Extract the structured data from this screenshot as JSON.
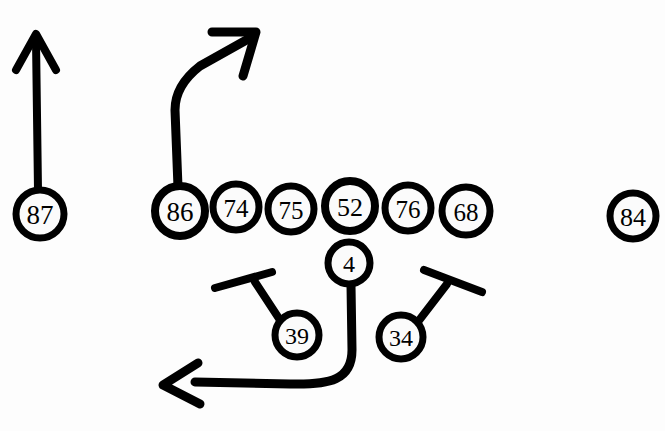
{
  "diagram": {
    "background_color": "#fdfdfd",
    "ink_color": "#000000",
    "fill_color": "#fbfbfb",
    "width": 665,
    "height": 431
  },
  "players": [
    {
      "id": "wr-left",
      "number": "87",
      "cx": 40,
      "cy": 214,
      "r": 24,
      "stroke": 7,
      "font_size": 27,
      "role": "split-end-left"
    },
    {
      "id": "te-86",
      "number": "86",
      "cx": 180,
      "cy": 211,
      "r": 25,
      "stroke": 8,
      "font_size": 27,
      "role": "tight-end-left"
    },
    {
      "id": "ol-74",
      "number": "74",
      "cx": 236,
      "cy": 207,
      "r": 23,
      "stroke": 7,
      "font_size": 25,
      "role": "offensive-line"
    },
    {
      "id": "ol-75",
      "number": "75",
      "cx": 291,
      "cy": 209,
      "r": 23,
      "stroke": 7,
      "font_size": 25,
      "role": "offensive-line"
    },
    {
      "id": "ol-52",
      "number": "52",
      "cx": 350,
      "cy": 206,
      "r": 25,
      "stroke": 8,
      "font_size": 26,
      "role": "center"
    },
    {
      "id": "ol-76",
      "number": "76",
      "cx": 408,
      "cy": 208,
      "r": 23,
      "stroke": 7,
      "font_size": 25,
      "role": "offensive-line"
    },
    {
      "id": "ol-68",
      "number": "68",
      "cx": 466,
      "cy": 211,
      "r": 24,
      "stroke": 7,
      "font_size": 25,
      "role": "offensive-line"
    },
    {
      "id": "qb-4",
      "number": "4",
      "cx": 349,
      "cy": 263,
      "r": 21,
      "stroke": 7,
      "font_size": 24,
      "role": "quarterback"
    },
    {
      "id": "rb-39",
      "number": "39",
      "cx": 297,
      "cy": 335,
      "r": 22,
      "stroke": 7,
      "font_size": 24,
      "role": "running-back-left"
    },
    {
      "id": "rb-34",
      "number": "34",
      "cx": 401,
      "cy": 337,
      "r": 22,
      "stroke": 7,
      "font_size": 24,
      "role": "running-back-right"
    },
    {
      "id": "wr-right",
      "number": "84",
      "cx": 633,
      "cy": 216,
      "r": 23,
      "stroke": 7,
      "font_size": 26,
      "role": "split-end-right"
    }
  ],
  "routes": [
    {
      "id": "route-87",
      "player": "87",
      "type": "go-route-arrow",
      "stroke": 8,
      "path": "M 38 190 L 36 40",
      "arrow": "M 16 70 L 36 34 L 56 70"
    },
    {
      "id": "route-86",
      "player": "86",
      "type": "corner-route-arrow",
      "stroke": 9,
      "path": "M 178 187 L 175 110 C 175 95 182 80 200 66 L 250 38",
      "arrow": "M 212 32 L 256 32 L 243 76"
    },
    {
      "id": "route-39",
      "player": "39",
      "type": "block-line",
      "stroke": 8,
      "path": "M 280 320 L 255 282",
      "block_bar": "M 215 288 L 272 272"
    },
    {
      "id": "route-34",
      "player": "34",
      "type": "block-line",
      "stroke": 8,
      "path": "M 417 323 L 447 284",
      "block_bar": "M 424 270 L 482 292"
    },
    {
      "id": "route-qb",
      "player": "4",
      "type": "sweep-left-arrow",
      "stroke": 9,
      "path": "M 351 285 L 352 350 C 352 380 330 385 290 384 L 195 382",
      "arrow": "M 198 363 L 163 385 L 200 404"
    }
  ]
}
